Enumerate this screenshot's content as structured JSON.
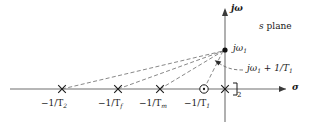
{
  "figure": {
    "kind": "s-plane pole-zero plot",
    "plane_label": {
      "italic": "s",
      "rest": " plane"
    },
    "axes": {
      "imaginary_label": "jω",
      "real_label": "σ",
      "origin_px": {
        "x": 225,
        "y": 89
      }
    },
    "annotations": {
      "pole_point_label_main": "jω",
      "pole_point_label_sub": "1",
      "vector_label_main": "jω",
      "vector_label_sub1": "1",
      "vector_label_tail": " + 1/T",
      "vector_label_sub2": "1",
      "multiplicity_bracket": "]",
      "multiplicity_value": "2"
    },
    "real_axis_marks": [
      {
        "name": "-1/T2",
        "type": "pole",
        "glyph": "×",
        "x": 62,
        "label_main": "−1/T",
        "label_sub": "2"
      },
      {
        "name": "-1/Tf",
        "type": "pole",
        "glyph": "×",
        "x": 118,
        "label_main": "−1/T",
        "label_sub": "f"
      },
      {
        "name": "-1/Tm",
        "type": "pole",
        "glyph": "×",
        "x": 160,
        "label_main": "−1/T",
        "label_sub": "m"
      },
      {
        "name": "-1/T1",
        "type": "zero",
        "glyph": "○",
        "x": 204,
        "label_main": "−1/T",
        "label_sub": "1"
      },
      {
        "name": "origin-double-pole",
        "type": "pole",
        "glyph": "×",
        "x": 225,
        "label_main": "",
        "label_sub": ""
      }
    ],
    "evaluation_point": {
      "name": "j-omega-1",
      "x": 225,
      "y": 50
    },
    "vectors": [
      {
        "from": "-1/T2",
        "to": "j-omega-1",
        "style": "dashed"
      },
      {
        "from": "-1/Tf",
        "to": "j-omega-1",
        "style": "dashed"
      },
      {
        "from": "-1/Tm",
        "to": "j-omega-1",
        "style": "dashed"
      },
      {
        "from": "-1/T1",
        "to": "j-omega-1",
        "style": "dashed"
      }
    ],
    "colors": {
      "axis": "#6f6f6f",
      "vector": "#7a7a7a",
      "ink": "#1a1a1a",
      "background": "#ffffff"
    }
  }
}
